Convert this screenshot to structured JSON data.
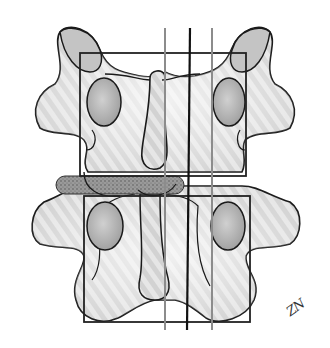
{
  "figure": {
    "signature": "ZN",
    "colors": {
      "bone_fill": "#e4e4e4",
      "bone_outline": "#1a1a1a",
      "pedicle_fill": "#b8b8b8",
      "implant_fill": "#8a8a8a",
      "guide_gray": "#8c8c8c",
      "guide_dark": "#111111",
      "frame": "#222222"
    },
    "elements": {
      "upper_vertebra": "upper-vertebra",
      "lower_vertebra": "lower-vertebra",
      "implant": "dotted-bar-implant",
      "frame_upper": "rectangular-frame-upper",
      "frame_lower": "rectangular-frame-lower",
      "guide_lines": [
        "gray-line-left",
        "black-line-center",
        "gray-line-right"
      ]
    }
  }
}
